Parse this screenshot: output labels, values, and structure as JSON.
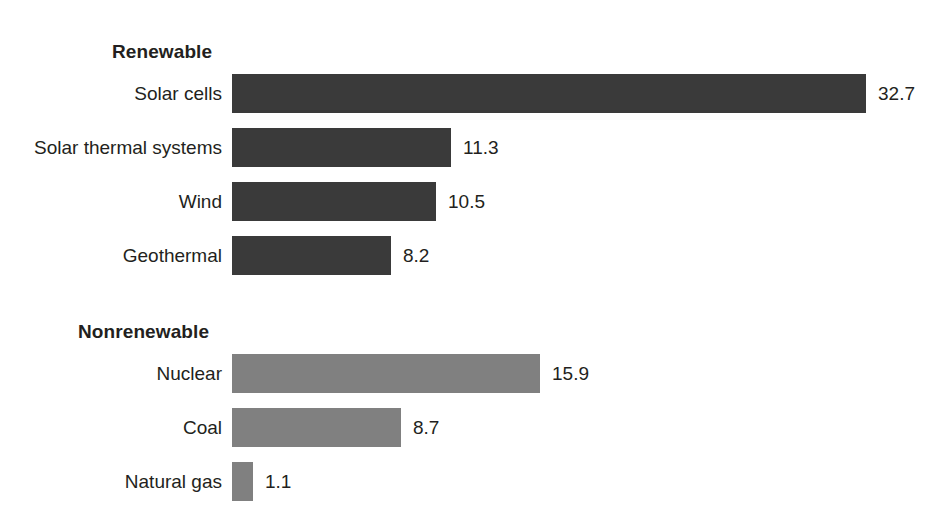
{
  "chart_data": {
    "type": "bar",
    "orientation": "horizontal",
    "title": "",
    "subtitle": "",
    "xlabel": "",
    "ylabel": "",
    "grid": false,
    "legend": "none",
    "axis_visible": false,
    "value_labels_shown": true,
    "xlim": [
      0,
      32.7
    ],
    "groups": [
      {
        "name": "Renewable",
        "color": "#3a3a3a",
        "color_name": "dark-gray",
        "categories": [
          "Solar cells",
          "Solar thermal systems",
          "Wind",
          "Geothermal"
        ],
        "values": [
          32.7,
          11.3,
          10.5,
          8.2
        ],
        "value_labels": [
          "32.7",
          "11.3",
          "10.5",
          "8.2"
        ]
      },
      {
        "name": "Nonrenewable",
        "color": "#808080",
        "color_name": "medium-gray",
        "categories": [
          "Nuclear",
          "Coal",
          "Natural gas"
        ],
        "values": [
          15.9,
          8.7,
          1.1
        ],
        "value_labels": [
          "15.9",
          "8.7",
          "1.1"
        ]
      }
    ],
    "categories": [
      "Solar cells",
      "Solar thermal systems",
      "Wind",
      "Geothermal",
      "Nuclear",
      "Coal",
      "Natural gas"
    ],
    "values": [
      32.7,
      11.3,
      10.5,
      8.2,
      15.9,
      8.7,
      1.1
    ]
  },
  "colors": {
    "renewable_bar": "#3a3a3a",
    "nonrenewable_bar": "#808080",
    "text": "#231f20",
    "background": "#ffffff"
  },
  "renewable": {
    "heading": "Renewable",
    "rows": [
      {
        "label": "Solar cells",
        "value": "32.7"
      },
      {
        "label": "Solar thermal systems",
        "value": "11.3"
      },
      {
        "label": "Wind",
        "value": "10.5"
      },
      {
        "label": "Geothermal",
        "value": "8.2"
      }
    ]
  },
  "nonrenewable": {
    "heading": "Nonrenewable",
    "rows": [
      {
        "label": "Nuclear",
        "value": "15.9"
      },
      {
        "label": "Coal",
        "value": "8.7"
      },
      {
        "label": "Natural gas",
        "value": "1.1"
      }
    ]
  }
}
